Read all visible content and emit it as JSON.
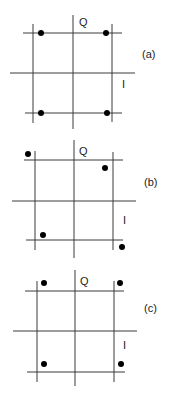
{
  "panels": [
    {
      "caption": "(a)",
      "axis_q_label": "Q",
      "axis_i_label": "I",
      "description": "4 points at grid corners (square constellation)",
      "points": [
        [
          41,
          33
        ],
        [
          106,
          33
        ],
        [
          41,
          113
        ],
        [
          107,
          113
        ]
      ]
    },
    {
      "caption": "(b)",
      "axis_q_label": "Q",
      "axis_i_label": "I",
      "description": "4 points distorted off the grid corners",
      "points": [
        [
          28,
          154
        ],
        [
          105,
          168
        ],
        [
          43,
          235
        ],
        [
          122,
          247
        ]
      ]
    },
    {
      "caption": "(c)",
      "axis_q_label": "Q",
      "axis_i_label": "I",
      "description": "4 points shifted outward above/below the grid lines",
      "points": [
        [
          44,
          283
        ],
        [
          120,
          283
        ],
        [
          44,
          364
        ],
        [
          121,
          364
        ]
      ]
    }
  ],
  "colors": {
    "line": "#3a3a3a",
    "dot": "#000000",
    "background": "#ffffff"
  }
}
